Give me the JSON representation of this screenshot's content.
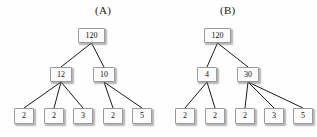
{
  "figure": {
    "background_color": "#fefefe",
    "node_fill": "#fbfbfb",
    "node_border": "#9a9a9a",
    "edge_color": "#1a1a1a"
  },
  "trees": [
    {
      "id": "A",
      "label": "(A)",
      "label_x": 95,
      "label_y": 4,
      "nodes": [
        {
          "id": "a-root",
          "name": "node-a-root",
          "value": "120",
          "x": 78,
          "y": 28,
          "w": 27,
          "h": 15
        },
        {
          "id": "a-m1",
          "name": "node-a-mid-1",
          "value": "12",
          "x": 50,
          "y": 67,
          "w": 22,
          "h": 15
        },
        {
          "id": "a-m2",
          "name": "node-a-mid-2",
          "value": "10",
          "x": 93,
          "y": 67,
          "w": 22,
          "h": 15
        },
        {
          "id": "a-l1",
          "name": "node-a-leaf-1",
          "value": "2",
          "x": 14,
          "y": 108,
          "w": 20,
          "h": 16
        },
        {
          "id": "a-l2",
          "name": "node-a-leaf-2",
          "value": "2",
          "x": 44,
          "y": 108,
          "w": 20,
          "h": 16
        },
        {
          "id": "a-l3",
          "name": "node-a-leaf-3",
          "value": "3",
          "x": 73,
          "y": 108,
          "w": 20,
          "h": 16
        },
        {
          "id": "a-l4",
          "name": "node-a-leaf-4",
          "value": "2",
          "x": 103,
          "y": 108,
          "w": 20,
          "h": 16
        },
        {
          "id": "a-l5",
          "name": "node-a-leaf-5",
          "value": "5",
          "x": 132,
          "y": 108,
          "w": 20,
          "h": 16
        }
      ],
      "edges": [
        {
          "from": "a-root",
          "to": "a-m1"
        },
        {
          "from": "a-root",
          "to": "a-m2"
        },
        {
          "from": "a-m1",
          "to": "a-l1"
        },
        {
          "from": "a-m1",
          "to": "a-l2"
        },
        {
          "from": "a-m1",
          "to": "a-l3"
        },
        {
          "from": "a-m2",
          "to": "a-l4"
        },
        {
          "from": "a-m2",
          "to": "a-l5"
        }
      ]
    },
    {
      "id": "B",
      "label": "(B)",
      "label_x": 220,
      "label_y": 4,
      "nodes": [
        {
          "id": "b-root",
          "name": "node-b-root",
          "value": "120",
          "x": 204,
          "y": 28,
          "w": 27,
          "h": 15
        },
        {
          "id": "b-m1",
          "name": "node-b-mid-1",
          "value": "4",
          "x": 197,
          "y": 67,
          "w": 20,
          "h": 15
        },
        {
          "id": "b-m2",
          "name": "node-b-mid-2",
          "value": "30",
          "x": 237,
          "y": 67,
          "w": 22,
          "h": 15
        },
        {
          "id": "b-l1",
          "name": "node-b-leaf-1",
          "value": "2",
          "x": 175,
          "y": 108,
          "w": 20,
          "h": 16
        },
        {
          "id": "b-l2",
          "name": "node-b-leaf-2",
          "value": "2",
          "x": 205,
          "y": 108,
          "w": 20,
          "h": 16
        },
        {
          "id": "b-l3",
          "name": "node-b-leaf-3",
          "value": "2",
          "x": 235,
          "y": 108,
          "w": 20,
          "h": 16
        },
        {
          "id": "b-l4",
          "name": "node-b-leaf-4",
          "value": "3",
          "x": 264,
          "y": 108,
          "w": 20,
          "h": 16
        },
        {
          "id": "b-l5",
          "name": "node-b-leaf-5",
          "value": "5",
          "x": 293,
          "y": 108,
          "w": 20,
          "h": 16
        }
      ],
      "edges": [
        {
          "from": "b-root",
          "to": "b-m1"
        },
        {
          "from": "b-root",
          "to": "b-m2"
        },
        {
          "from": "b-m1",
          "to": "b-l1"
        },
        {
          "from": "b-m1",
          "to": "b-l2"
        },
        {
          "from": "b-m2",
          "to": "b-l3"
        },
        {
          "from": "b-m2",
          "to": "b-l4"
        },
        {
          "from": "b-m2",
          "to": "b-l5"
        }
      ]
    }
  ]
}
